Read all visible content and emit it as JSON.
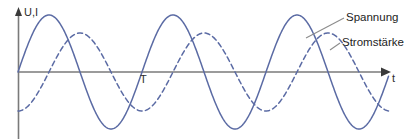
{
  "figure": {
    "background": "#ffffff",
    "width": 419,
    "height": 139
  },
  "axes": {
    "y_label": "U,I",
    "x_label": "t",
    "period_marker": "T",
    "axis_color": "#7a7a7a",
    "origin_x": 18,
    "zero_line_y": 72,
    "x_axis_end": 390,
    "y_axis_top": 10
  },
  "legend": {
    "position": "right",
    "items": [
      {
        "label": "Spannung",
        "style": "solid",
        "color": "#5b6ba4"
      },
      {
        "label": "Stromstärke",
        "style": "dashed",
        "color": "#5b6ba4"
      }
    ]
  },
  "chart_data": {
    "type": "line",
    "title": "",
    "xlabel": "t",
    "ylabel": "U,I",
    "grid": false,
    "legend_position": "right",
    "annotations": [
      {
        "text": "T",
        "meaning": "period",
        "x_px": 142,
        "y_px": 80
      }
    ],
    "axis_ranges": {
      "x_px": [
        18,
        390
      ],
      "y_px": [
        10,
        139
      ]
    },
    "wave_geometry": {
      "period_px": 124,
      "zero_line_y_px": 72,
      "voltage_amplitude_px": 57,
      "current_amplitude_px": 39,
      "voltage_phase_deg": 0,
      "current_phase_deg": -90,
      "note": "Current lags voltage by a quarter period (90 degrees)."
    },
    "series": [
      {
        "name": "Spannung",
        "style": "solid",
        "color": "#5b6ba4",
        "amplitude_rel": 1.0,
        "phase_deg": 0,
        "period_px": 124,
        "values_deg": [
          0,
          45,
          90,
          135,
          180,
          225,
          270,
          315,
          360
        ],
        "values_rel": [
          0.0,
          0.71,
          1.0,
          0.71,
          0.0,
          -0.71,
          -1.0,
          -0.71,
          0.0
        ]
      },
      {
        "name": "Stromstärke",
        "style": "dashed",
        "color": "#5b6ba4",
        "amplitude_rel": 0.68,
        "phase_deg": -90,
        "period_px": 124,
        "values_deg": [
          0,
          45,
          90,
          135,
          180,
          225,
          270,
          315,
          360
        ],
        "values_rel": [
          -0.68,
          -0.48,
          0.0,
          0.48,
          0.68,
          0.48,
          0.0,
          -0.48,
          -0.68
        ]
      }
    ]
  }
}
